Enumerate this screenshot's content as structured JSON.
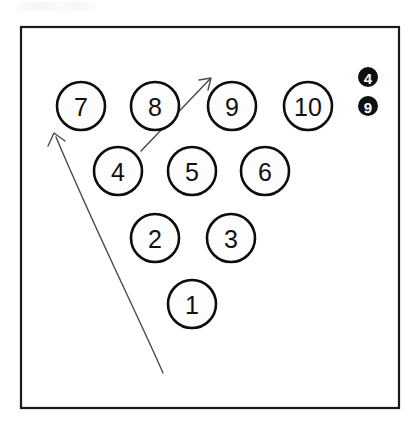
{
  "diagram": {
    "background_color": "#ffffff",
    "frame": {
      "name": "outer-frame",
      "x": 21,
      "y": 27,
      "width": 378,
      "height": 381,
      "stroke_color": "#1a1a1a"
    },
    "pin_circle": {
      "radius": 24,
      "fill_color": "#fdfdfd",
      "stroke_color": "#0d0d0d"
    },
    "pins": [
      {
        "label": "7",
        "cx": 81,
        "cy": 106,
        "row": 4
      },
      {
        "label": "8",
        "cx": 155,
        "cy": 106,
        "row": 4
      },
      {
        "label": "9",
        "cx": 232,
        "cy": 106,
        "row": 4
      },
      {
        "label": "10",
        "cx": 308,
        "cy": 106,
        "row": 4
      },
      {
        "label": "4",
        "cx": 118,
        "cy": 171,
        "row": 3
      },
      {
        "label": "5",
        "cx": 192,
        "cy": 171,
        "row": 3
      },
      {
        "label": "6",
        "cx": 265,
        "cy": 171,
        "row": 3
      },
      {
        "label": "2",
        "cx": 155,
        "cy": 238,
        "row": 2
      },
      {
        "label": "3",
        "cx": 231,
        "cy": 238,
        "row": 2
      },
      {
        "label": "1",
        "cx": 192,
        "cy": 304,
        "row": 1
      }
    ],
    "badges": [
      {
        "label": "4",
        "cx": 368,
        "cy": 77,
        "radius": 10,
        "fill_color": "#101010",
        "text_color": "#ffffff"
      },
      {
        "label": "9",
        "cx": 368,
        "cy": 106,
        "radius": 10,
        "fill_color": "#101010",
        "text_color": "#ffffff"
      }
    ],
    "arrows": [
      {
        "name": "short-arrow",
        "path": "M 141 151 L 210 79",
        "head": "M 199 80 L 211 78 L 208 90",
        "stroke_color": "#4a4a4a",
        "direction": "up-right"
      },
      {
        "name": "long-curved-arrow",
        "path": "M 163 373 C 140 320 96 232 56 137",
        "head": "M 48 146 L 54 133 L 65 141",
        "stroke_color": "#4a4a4a",
        "direction": "up-left"
      }
    ]
  }
}
